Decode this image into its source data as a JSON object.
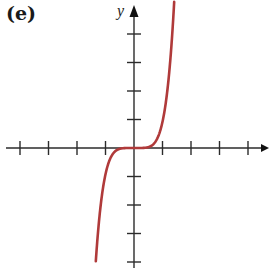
{
  "panel_label": "(e)",
  "colors": {
    "axis": "#2b2b2b",
    "curve": "#b03a3a",
    "background": "#ffffff"
  },
  "chart_data": {
    "type": "line",
    "title": "(e)",
    "xlabel": "",
    "ylabel": "y",
    "function": "y = x^5 (odd power, flat at origin)",
    "origin_px": [
      134,
      148
    ],
    "tick_spacing_px": 28.5,
    "x_ticks": [
      -4,
      -3,
      -2,
      -1,
      1,
      2,
      3,
      4
    ],
    "y_ticks": [
      -4,
      -3,
      -2,
      -1,
      1,
      2,
      3,
      4
    ],
    "xlim": [
      -4.7,
      4.7
    ],
    "ylim": [
      -4.2,
      5.0
    ],
    "grid": false,
    "tick_labels_shown": false,
    "series": [
      {
        "name": "curve",
        "color": "#b03a3a",
        "x": [
          -1.33,
          -1.2,
          -1.0,
          -0.8,
          -0.6,
          -0.4,
          -0.2,
          0,
          0.2,
          0.4,
          0.6,
          0.8,
          1.0,
          1.2,
          1.4
        ],
        "y": [
          -4.2,
          -2.5,
          -1.0,
          -0.33,
          -0.08,
          -0.01,
          0.0,
          0,
          0.0,
          0.01,
          0.08,
          0.33,
          1.0,
          2.5,
          4.9
        ]
      }
    ]
  }
}
